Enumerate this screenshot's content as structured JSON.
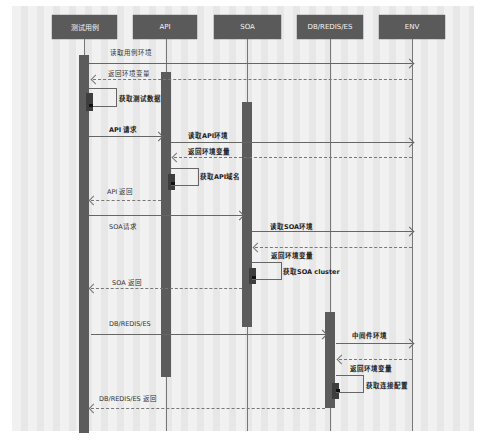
{
  "diagram": {
    "type": "sequence",
    "participants": [
      {
        "id": "testcase",
        "label": "测试用例"
      },
      {
        "id": "api",
        "label": "API"
      },
      {
        "id": "soa",
        "label": "SOA"
      },
      {
        "id": "db",
        "label": "DB/REDIS/ES"
      },
      {
        "id": "env",
        "label": "ENV"
      }
    ],
    "messages": [
      {
        "from": "testcase",
        "to": "env",
        "label": "读取用例环境",
        "style": "solid"
      },
      {
        "from": "env",
        "to": "testcase",
        "label": "返回环境变量",
        "style": "dashed"
      },
      {
        "from": "testcase",
        "to": "testcase",
        "label": "获取测试数据",
        "style": "self"
      },
      {
        "from": "testcase",
        "to": "api",
        "label": "API 请求",
        "style": "solid"
      },
      {
        "from": "api",
        "to": "env",
        "label": "读取API环境",
        "style": "solid"
      },
      {
        "from": "env",
        "to": "api",
        "label": "返回环境变量",
        "style": "dashed"
      },
      {
        "from": "api",
        "to": "api",
        "label": "获取API域名",
        "style": "self"
      },
      {
        "from": "api",
        "to": "testcase",
        "label": "API 返回",
        "style": "dashed"
      },
      {
        "from": "testcase",
        "to": "soa",
        "label": "SOA请求",
        "style": "solid"
      },
      {
        "from": "soa",
        "to": "env",
        "label": "读取SOA环境",
        "style": "solid"
      },
      {
        "from": "env",
        "to": "soa",
        "label": "返回环境变量",
        "style": "dashed"
      },
      {
        "from": "soa",
        "to": "soa",
        "label": "获取SOA cluster",
        "style": "self"
      },
      {
        "from": "soa",
        "to": "testcase",
        "label": "SOA 返回",
        "style": "dashed"
      },
      {
        "from": "testcase",
        "to": "db",
        "label": "DB/REDIS/ES",
        "style": "solid"
      },
      {
        "from": "db",
        "to": "env",
        "label": "中间件环境",
        "style": "solid"
      },
      {
        "from": "env",
        "to": "db",
        "label": "返回环境变量",
        "style": "dashed"
      },
      {
        "from": "db",
        "to": "db",
        "label": "获取连接配置",
        "style": "self"
      },
      {
        "from": "db",
        "to": "testcase",
        "label": "DB/REDIS/ES 返回",
        "style": "dashed"
      }
    ]
  },
  "colors": {
    "header_bg": "#5a5a5a",
    "header_text": "#f4f4f4",
    "activation": "#5c5c5c",
    "line": "#666666"
  }
}
